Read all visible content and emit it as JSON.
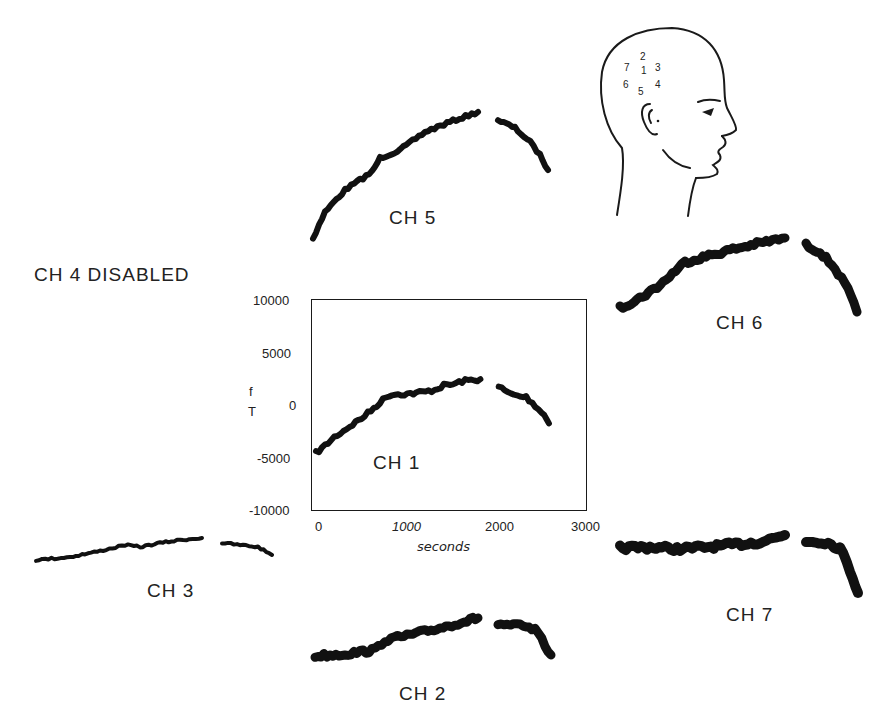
{
  "labels": {
    "ch4_disabled": "CH 4 DISABLED",
    "ch1": "CH 1",
    "ch2": "CH 2",
    "ch3": "CH 3",
    "ch5": "CH 5",
    "ch6": "CH 6",
    "ch7": "CH 7"
  },
  "head_diagram": {
    "electrode_numbers": [
      "1",
      "2",
      "3",
      "4",
      "5",
      "6",
      "7"
    ]
  },
  "chart_data": {
    "type": "line",
    "title": "",
    "xlabel": "seconds",
    "ylabel": "fT",
    "ylabel_chars": [
      "f",
      "T"
    ],
    "xlim": [
      0,
      3000
    ],
    "ylim": [
      -10000,
      10000
    ],
    "xticks": [
      "0",
      "1000",
      "2000",
      "3000"
    ],
    "yticks": [
      "10000",
      "5000",
      "0",
      "-5000",
      "-10000"
    ],
    "grid": false,
    "gap": [
      1800,
      2000
    ],
    "series": [
      {
        "name": "CH 1",
        "x": [
          0,
          100,
          200,
          300,
          400,
          500,
          600,
          700,
          800,
          900,
          1000,
          1100,
          1200,
          1300,
          1400,
          1500,
          1600,
          1700,
          1800,
          2000,
          2100,
          2200,
          2300,
          2400,
          2500,
          2550
        ],
        "values": [
          -4500,
          -3800,
          -3000,
          -2400,
          -1800,
          -1200,
          -500,
          300,
          1000,
          1100,
          1100,
          1200,
          1300,
          1500,
          1900,
          2000,
          2300,
          2400,
          2500,
          1800,
          1200,
          900,
          800,
          0,
          -900,
          -1700
        ]
      }
    ]
  },
  "small_traces": [
    {
      "name": "CH 5",
      "note": "rising then falling, no axes"
    },
    {
      "name": "CH 6",
      "note": "rising then falling, no axes"
    },
    {
      "name": "CH 7",
      "note": "flat then falling, no axes"
    },
    {
      "name": "CH 3",
      "note": "slowly rising then falling, no axes"
    },
    {
      "name": "CH 2",
      "note": "slowly rising then falling, no axes"
    }
  ]
}
